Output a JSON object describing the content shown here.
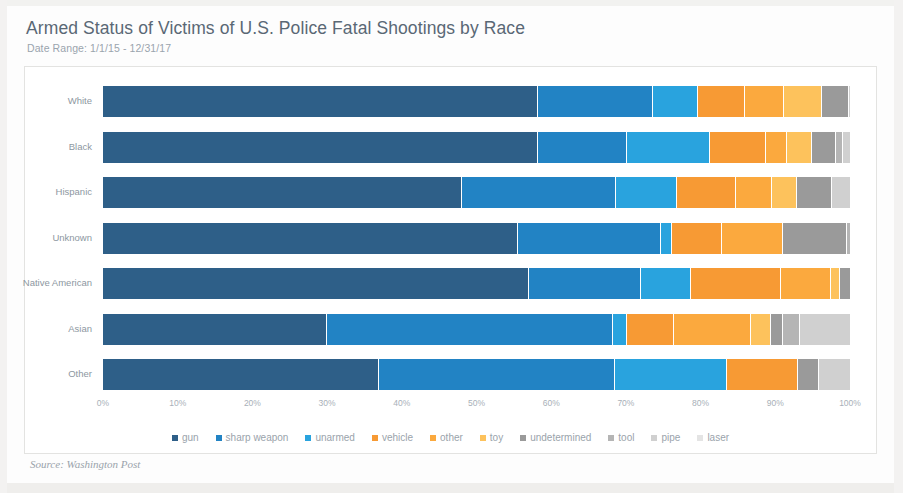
{
  "header": {
    "title": "Armed Status of Victims of U.S. Police Fatal Shootings by Race",
    "subtitle": "Date Range: 1/1/15 - 12/31/17"
  },
  "footer": {
    "source": "Source: Washington Post"
  },
  "chart_data": {
    "type": "bar",
    "orientation": "horizontal",
    "stacked": true,
    "normalized": true,
    "title": "Armed Status of Victims of U.S. Police Fatal Shootings by Race",
    "subtitle": "Date Range: 1/1/15 - 12/31/17",
    "xlabel": "",
    "ylabel": "",
    "xlim": [
      0,
      100
    ],
    "xtick_labels": [
      "0%",
      "10%",
      "20%",
      "30%",
      "40%",
      "50%",
      "60%",
      "70%",
      "80%",
      "90%",
      "100%"
    ],
    "xtick_values": [
      0,
      10,
      20,
      30,
      40,
      50,
      60,
      70,
      80,
      90,
      100
    ],
    "grid": false,
    "legend_position": "bottom",
    "categories": [
      "White",
      "Black",
      "Hispanic",
      "Unknown",
      "Native American",
      "Asian",
      "Other"
    ],
    "series": [
      {
        "name": "gun",
        "color": "#2e5f88",
        "values": [
          58.2,
          58.2,
          48.0,
          55.5,
          57.0,
          30.0,
          37.0
        ]
      },
      {
        "name": "sharp weapon",
        "color": "#2283c4",
        "values": [
          15.4,
          12.0,
          20.7,
          19.2,
          15.0,
          38.3,
          31.5
        ]
      },
      {
        "name": "unarmed",
        "color": "#29a3de",
        "values": [
          6.1,
          11.0,
          8.2,
          1.5,
          6.7,
          1.9,
          15.1
        ]
      },
      {
        "name": "vehicle",
        "color": "#f79a34",
        "values": [
          6.2,
          7.6,
          7.9,
          6.6,
          12.0,
          6.2,
          9.4
        ]
      },
      {
        "name": "other",
        "color": "#fba93e",
        "values": [
          5.2,
          2.8,
          4.8,
          8.2,
          6.8,
          10.3,
          0.0
        ]
      },
      {
        "name": "toy",
        "color": "#fdc25c",
        "values": [
          5.2,
          3.3,
          3.3,
          0.0,
          1.2,
          2.7,
          0.0
        ]
      },
      {
        "name": "undetermined",
        "color": "#9a9a9a",
        "values": [
          3.6,
          3.3,
          4.7,
          8.6,
          1.3,
          1.6,
          2.9
        ]
      },
      {
        "name": "tool",
        "color": "#b5b5b5",
        "values": [
          0.0,
          0.9,
          0.0,
          0.4,
          0.0,
          2.3,
          0.0
        ]
      },
      {
        "name": "pipe",
        "color": "#d0d0d0",
        "values": [
          0.1,
          0.9,
          2.4,
          0.0,
          0.0,
          6.7,
          4.1
        ]
      },
      {
        "name": "laser",
        "color": "#e4e4e4",
        "values": [
          0.0,
          0.0,
          0.0,
          0.0,
          0.0,
          0.0,
          0.0
        ]
      }
    ],
    "legend": [
      {
        "label": "gun",
        "color": "#2e5f88"
      },
      {
        "label": "sharp weapon",
        "color": "#2283c4"
      },
      {
        "label": "unarmed",
        "color": "#29a3de"
      },
      {
        "label": "vehicle",
        "color": "#f79a34"
      },
      {
        "label": "other",
        "color": "#fba93e"
      },
      {
        "label": "toy",
        "color": "#fdc25c"
      },
      {
        "label": "undetermined",
        "color": "#9a9a9a"
      },
      {
        "label": "tool",
        "color": "#b5b5b5"
      },
      {
        "label": "pipe",
        "color": "#d0d0d0"
      },
      {
        "label": "laser",
        "color": "#e4e4e4"
      }
    ]
  }
}
